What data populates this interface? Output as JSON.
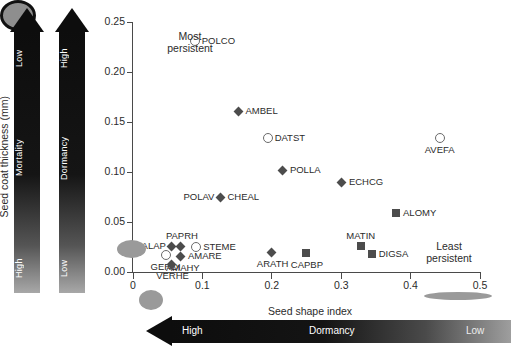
{
  "chart_data": {
    "type": "scatter",
    "title": "",
    "xlabel": "Seed shape index",
    "ylabel": "Seed coat thickness (mm)",
    "xlim": [
      0,
      0.5
    ],
    "ylim": [
      0.0,
      0.25
    ],
    "xticks": [
      "0",
      "0.1",
      "0.2",
      "0.3",
      "0.4",
      "0.5"
    ],
    "yticks": [
      "0.00",
      "0.05",
      "0.10",
      "0.15",
      "0.20",
      "0.25"
    ],
    "grid": false,
    "legend": "none",
    "points": [
      {
        "label": "POLCO",
        "x": 0.089,
        "y": 0.231,
        "marker": "circle",
        "label_pos": "right"
      },
      {
        "label": "AMBEL",
        "x": 0.152,
        "y": 0.161,
        "marker": "diamond",
        "label_pos": "right"
      },
      {
        "label": "DATST",
        "x": 0.194,
        "y": 0.134,
        "marker": "circle",
        "label_pos": "right"
      },
      {
        "label": "AVEFA",
        "x": 0.442,
        "y": 0.134,
        "marker": "circle",
        "label_pos": "below"
      },
      {
        "label": "POLLA",
        "x": 0.216,
        "y": 0.102,
        "marker": "diamond",
        "label_pos": "right"
      },
      {
        "label": "ECHCG",
        "x": 0.301,
        "y": 0.09,
        "marker": "diamond",
        "label_pos": "right"
      },
      {
        "label": "CHEAL",
        "x": 0.126,
        "y": 0.075,
        "marker": "diamond",
        "label_pos": "right"
      },
      {
        "label": "POLAV",
        "x": 0.126,
        "y": 0.075,
        "marker": "none",
        "label_pos": "left"
      },
      {
        "label": "ALOMY",
        "x": 0.379,
        "y": 0.059,
        "marker": "square",
        "label_pos": "right"
      },
      {
        "label": "MATIN",
        "x": 0.329,
        "y": 0.026,
        "marker": "square",
        "label_pos": "above"
      },
      {
        "label": "DIGSA",
        "x": 0.344,
        "y": 0.018,
        "marker": "square",
        "label_pos": "right"
      },
      {
        "label": "GALAP",
        "x": 0.055,
        "y": 0.026,
        "marker": "diamond",
        "label_pos": "left"
      },
      {
        "label": "PAPRH",
        "x": 0.069,
        "y": 0.026,
        "marker": "diamond",
        "label_pos": "above"
      },
      {
        "label": "STEME",
        "x": 0.091,
        "y": 0.025,
        "marker": "circle",
        "label_pos": "right"
      },
      {
        "label": "GERDI",
        "x": 0.047,
        "y": 0.017,
        "marker": "circle",
        "label_pos": "below"
      },
      {
        "label": "AMARE",
        "x": 0.069,
        "y": 0.016,
        "marker": "diamond",
        "label_pos": "right"
      },
      {
        "label": "AMAHY",
        "x": 0.069,
        "y": 0.016,
        "marker": "none",
        "label_pos": "below"
      },
      {
        "label": "VERHE",
        "x": 0.055,
        "y": 0.008,
        "marker": "diamond",
        "label_pos": "below"
      },
      {
        "label": "ARATH",
        "x": 0.2,
        "y": 0.02,
        "marker": "diamond",
        "label_pos": "below"
      },
      {
        "label": "CAPBP",
        "x": 0.249,
        "y": 0.019,
        "marker": "square",
        "label_pos": "below"
      }
    ],
    "annotations": [
      {
        "name": "most-persistent",
        "text": "Most\npersistent"
      },
      {
        "name": "least-persistent",
        "text": "Least\npersistent"
      }
    ]
  },
  "axes": {
    "x_label": "Seed shape index",
    "y_label": "Seed coat thickness (mm)",
    "x_ticks": [
      "0",
      "0.1",
      "0.2",
      "0.3",
      "0.4",
      "0.5"
    ],
    "y_ticks": [
      "0.25",
      "0.20",
      "0.15",
      "0.10",
      "0.05",
      "0.00"
    ]
  },
  "annotations": {
    "most_persistent_line1": "Most",
    "most_persistent_line2": "persistent",
    "least_persistent_line1": "Least",
    "least_persistent_line2": "persistent"
  },
  "arrows": {
    "mortality": {
      "title": "Mortality",
      "top_label": "Low",
      "bottom_label": "High"
    },
    "dormancy_vertical": {
      "title": "Dormancy",
      "top_label": "High",
      "bottom_label": "Low"
    },
    "dormancy_horizontal": {
      "title": "Dormancy",
      "left_label": "High",
      "right_label": "Low"
    }
  },
  "colors": {
    "marker_fill": "#4c4c4c",
    "marker_open_edge": "#6a6a6a",
    "axis": "#4a4a4a",
    "arrow_dark": "#0d0d0d",
    "seed_gray": "#9a9a9a",
    "text": "#2b2b2b"
  },
  "seed_glyphs": [
    {
      "name": "seed-round-outlined",
      "shape": "round"
    },
    {
      "name": "seed-oval-left",
      "shape": "oval"
    },
    {
      "name": "seed-oval-bottom",
      "shape": "oval"
    },
    {
      "name": "seed-flat-right",
      "shape": "flat-ellipse"
    }
  ]
}
